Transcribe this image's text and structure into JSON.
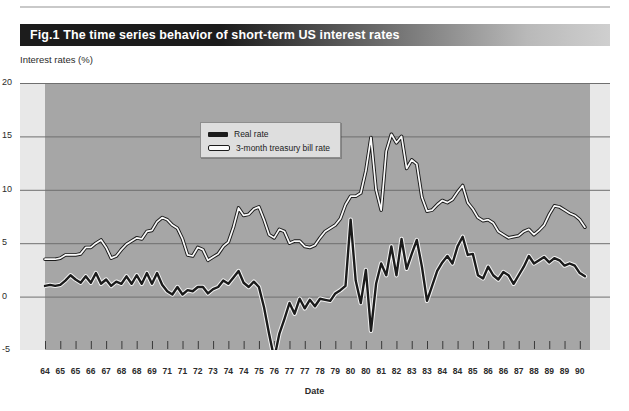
{
  "figure": {
    "title": "Fig.1 The time series behavior of short-term US interest rates",
    "colors": {
      "title_bar_dark": "#1c1c1c",
      "title_bar_light": "#cfcfcf",
      "plot_background": "#a6a6a6",
      "plot_margin": "#e8e8e8",
      "gridline": "#6f6f6f",
      "real_rate_line": "#1b1b1b",
      "tbill_line_fill": "#fbfbfb",
      "tbill_line_outline": "#1b1b1b"
    }
  },
  "legend": {
    "position": "inside-top-center",
    "entries": [
      {
        "label": "Real rate",
        "style": "solid-black"
      },
      {
        "label": "3-month treasury bill rate",
        "style": "white-outlined"
      }
    ]
  },
  "chart_data": {
    "type": "line",
    "title": "Fig.1 The time series behavior of short-term US interest rates",
    "subtitle": "",
    "xlabel": "Date",
    "ylabel": "Interest rates (%)",
    "grid": true,
    "ylim": [
      -7,
      20
    ],
    "yticks": [
      20,
      15,
      10,
      5,
      0,
      -5
    ],
    "ytick_labels": [
      "20",
      "15",
      "10",
      "5",
      "0",
      "-5"
    ],
    "xlim": [
      1964.0,
      1990.75
    ],
    "xtick_labels": [
      "64",
      "65",
      "65",
      "66",
      "67",
      "68",
      "68",
      "69",
      "71",
      "71",
      "72",
      "73",
      "74",
      "74",
      "75",
      "76",
      "77",
      "77",
      "78",
      "79",
      "80",
      "80",
      "81",
      "82",
      "83",
      "83",
      "84",
      "84",
      "85",
      "86",
      "86",
      "87",
      "88",
      "89",
      "89",
      "90"
    ],
    "xtick_values": [
      1964.0,
      1964.75,
      1965.5,
      1966.25,
      1967.0,
      1967.75,
      1968.5,
      1969.25,
      1970.0,
      1970.75,
      1971.5,
      1972.25,
      1973.0,
      1973.75,
      1974.5,
      1975.25,
      1976.0,
      1976.75,
      1977.5,
      1978.25,
      1979.0,
      1979.75,
      1980.5,
      1981.25,
      1982.0,
      1982.75,
      1983.5,
      1984.25,
      1985.0,
      1985.75,
      1986.5,
      1987.25,
      1988.0,
      1988.75,
      1989.5,
      1990.25
    ],
    "legend_position": "upper center inside axes",
    "series": [
      {
        "name": "3-month treasury bill rate",
        "style": "white-outlined",
        "x": [
          1964.0,
          1964.25,
          1964.5,
          1964.75,
          1965.0,
          1965.25,
          1965.5,
          1965.75,
          1966.0,
          1966.25,
          1966.5,
          1966.75,
          1967.0,
          1967.25,
          1967.5,
          1967.75,
          1968.0,
          1968.25,
          1968.5,
          1968.75,
          1969.0,
          1969.25,
          1969.5,
          1969.75,
          1970.0,
          1970.25,
          1970.5,
          1970.75,
          1971.0,
          1971.25,
          1971.5,
          1971.75,
          1972.0,
          1972.25,
          1972.5,
          1972.75,
          1973.0,
          1973.25,
          1973.5,
          1973.75,
          1974.0,
          1974.25,
          1974.5,
          1974.75,
          1975.0,
          1975.25,
          1975.5,
          1975.75,
          1976.0,
          1976.25,
          1976.5,
          1976.75,
          1977.0,
          1977.25,
          1977.5,
          1977.75,
          1978.0,
          1978.25,
          1978.5,
          1978.75,
          1979.0,
          1979.25,
          1979.5,
          1979.75,
          1980.0,
          1980.25,
          1980.5,
          1980.75,
          1981.0,
          1981.25,
          1981.5,
          1981.75,
          1982.0,
          1982.25,
          1982.5,
          1982.75,
          1983.0,
          1983.25,
          1983.5,
          1983.75,
          1984.0,
          1984.25,
          1984.5,
          1984.75,
          1985.0,
          1985.25,
          1985.5,
          1985.75,
          1986.0,
          1986.25,
          1986.5,
          1986.75,
          1987.0,
          1987.25,
          1987.5,
          1987.75,
          1988.0,
          1988.25,
          1988.5,
          1988.75,
          1989.0,
          1989.25,
          1989.5,
          1989.75,
          1990.0,
          1990.25,
          1990.5
        ],
        "values": [
          3.5,
          3.5,
          3.5,
          3.6,
          3.9,
          3.9,
          3.9,
          4.0,
          4.6,
          4.6,
          5.0,
          5.3,
          4.6,
          3.6,
          3.8,
          4.4,
          4.9,
          5.2,
          5.5,
          5.4,
          6.1,
          6.2,
          7.0,
          7.4,
          7.2,
          6.7,
          6.4,
          5.4,
          3.9,
          3.8,
          4.6,
          4.4,
          3.4,
          3.7,
          4.0,
          4.7,
          5.1,
          6.5,
          8.3,
          7.6,
          7.7,
          8.2,
          8.4,
          7.2,
          5.8,
          5.5,
          6.3,
          6.1,
          5.0,
          5.2,
          5.2,
          4.7,
          4.6,
          4.8,
          5.5,
          6.1,
          6.4,
          6.7,
          7.3,
          8.6,
          9.4,
          9.4,
          9.7,
          11.8,
          14.9,
          10.0,
          8.1,
          13.6,
          15.2,
          14.4,
          15.0,
          12.0,
          12.8,
          12.4,
          9.3,
          8.0,
          8.1,
          8.6,
          9.0,
          8.8,
          9.1,
          9.8,
          10.4,
          8.8,
          8.2,
          7.4,
          7.1,
          7.2,
          6.9,
          6.1,
          5.8,
          5.5,
          5.6,
          5.7,
          6.1,
          6.3,
          5.8,
          6.2,
          6.7,
          7.7,
          8.5,
          8.4,
          8.1,
          7.8,
          7.6,
          7.2,
          6.5
        ]
      },
      {
        "name": "Real rate",
        "style": "solid-black",
        "x": [
          1964.0,
          1964.25,
          1964.5,
          1964.75,
          1965.0,
          1965.25,
          1965.5,
          1965.75,
          1966.0,
          1966.25,
          1966.5,
          1966.75,
          1967.0,
          1967.25,
          1967.5,
          1967.75,
          1968.0,
          1968.25,
          1968.5,
          1968.75,
          1969.0,
          1969.25,
          1969.5,
          1969.75,
          1970.0,
          1970.25,
          1970.5,
          1970.75,
          1971.0,
          1971.25,
          1971.5,
          1971.75,
          1972.0,
          1972.25,
          1972.5,
          1972.75,
          1973.0,
          1973.25,
          1973.5,
          1973.75,
          1974.0,
          1974.25,
          1974.5,
          1974.75,
          1975.0,
          1975.25,
          1975.5,
          1975.75,
          1976.0,
          1976.25,
          1976.5,
          1976.75,
          1977.0,
          1977.25,
          1977.5,
          1977.75,
          1978.0,
          1978.25,
          1978.5,
          1978.75,
          1979.0,
          1979.25,
          1979.5,
          1979.75,
          1980.0,
          1980.25,
          1980.5,
          1980.75,
          1981.0,
          1981.25,
          1981.5,
          1981.75,
          1982.0,
          1982.25,
          1982.5,
          1982.75,
          1983.0,
          1983.25,
          1983.5,
          1983.75,
          1984.0,
          1984.25,
          1984.5,
          1984.75,
          1985.0,
          1985.25,
          1985.5,
          1985.75,
          1986.0,
          1986.25,
          1986.5,
          1986.75,
          1987.0,
          1987.25,
          1987.5,
          1987.75,
          1988.0,
          1988.25,
          1988.5,
          1988.75,
          1989.0,
          1989.25,
          1989.5,
          1989.75,
          1990.0,
          1990.25,
          1990.5
        ],
        "values": [
          1.0,
          1.1,
          1.0,
          1.1,
          1.5,
          2.0,
          1.6,
          1.3,
          1.9,
          1.3,
          2.2,
          1.2,
          1.6,
          1.0,
          1.4,
          1.2,
          1.9,
          1.2,
          2.0,
          1.2,
          2.2,
          1.2,
          2.2,
          1.1,
          0.5,
          0.2,
          0.9,
          0.2,
          0.6,
          0.5,
          0.9,
          0.9,
          0.3,
          0.7,
          0.9,
          1.5,
          1.2,
          1.8,
          2.4,
          1.3,
          0.9,
          1.4,
          0.9,
          -1.0,
          -3.5,
          -5.8,
          -3.5,
          -2.1,
          -0.6,
          -1.6,
          -0.2,
          -1.1,
          -0.3,
          -0.9,
          -0.2,
          -0.3,
          -0.4,
          0.3,
          0.6,
          1.0,
          7.2,
          1.5,
          -0.6,
          2.5,
          -3.2,
          1.2,
          3.1,
          2.0,
          4.7,
          2.0,
          5.4,
          2.6,
          4.0,
          5.3,
          2.8,
          -0.4,
          1.0,
          2.4,
          3.2,
          3.8,
          3.1,
          4.7,
          5.6,
          3.9,
          4.0,
          2.0,
          1.7,
          2.8,
          2.0,
          1.6,
          2.3,
          2.0,
          1.2,
          2.0,
          2.8,
          3.8,
          3.1,
          3.4,
          3.7,
          3.2,
          3.6,
          3.4,
          2.9,
          3.1,
          2.9,
          2.2,
          1.9
        ]
      }
    ]
  },
  "axes": {
    "y_title": "Interest rates (%)",
    "x_title": "Date"
  }
}
